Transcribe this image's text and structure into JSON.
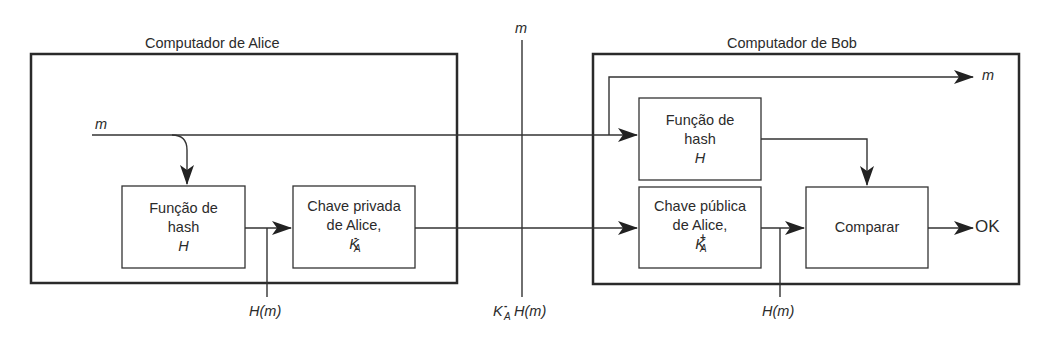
{
  "diagram": {
    "alice": {
      "title": "Computador de Alice",
      "input_label": "m",
      "hash_box": {
        "line1": "Função de",
        "line2": "hash",
        "line3": "H"
      },
      "private_key_box": {
        "line1": "Chave privada",
        "line2": "de Alice,",
        "key_base": "K",
        "key_sup": "-",
        "key_sub": "A"
      },
      "tap_label": "H(m)"
    },
    "channel": {
      "top_label": "m",
      "bottom_label_key": "K",
      "bottom_label_sup": "-",
      "bottom_label_sub": "A",
      "bottom_label_rest": "H(m)"
    },
    "bob": {
      "title": "Computador de Bob",
      "output_message_label": "m",
      "hash_box": {
        "line1": "Função de",
        "line2": "hash",
        "line3": "H"
      },
      "public_key_box": {
        "line1": "Chave pública",
        "line2": "de Alice,",
        "key_base": "K",
        "key_sup": "+",
        "key_sub": "A"
      },
      "compare_box": {
        "label": "Comparar"
      },
      "result_label": "OK",
      "tap_label": "H(m)"
    },
    "colors": {
      "line": "#2a2a2a",
      "background": "#ffffff"
    }
  }
}
